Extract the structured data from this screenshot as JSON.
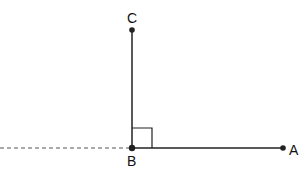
{
  "diagram": {
    "type": "geometry",
    "colors": {
      "stroke": "#222222",
      "dashed": "#555555",
      "point": "#222222"
    },
    "points": {
      "A": {
        "label": "A",
        "x": 283,
        "y": 148
      },
      "B": {
        "label": "B",
        "x": 132,
        "y": 148
      },
      "C": {
        "label": "C",
        "x": 132,
        "y": 30
      }
    },
    "segments": [
      {
        "from": "B",
        "to": "A",
        "style": "solid"
      },
      {
        "from": "B",
        "to": "C",
        "style": "solid"
      }
    ],
    "extension": {
      "from": "B",
      "direction": "left",
      "style": "dashed"
    },
    "right_angle_marker": {
      "at": "B",
      "size": 20
    }
  }
}
